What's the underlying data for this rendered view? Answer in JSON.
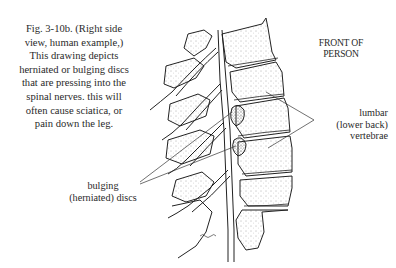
{
  "figure": {
    "caption_lines": [
      "Fig. 3-10b. (Right side",
      "view, human example,)",
      "This drawing depicts",
      "herniated or bulging discs",
      "that are pressing into the",
      "spinal nerves. this will",
      "often cause sciatica, or",
      "pain down the leg."
    ],
    "orientation_label_lines": [
      "FRONT OF",
      "PERSON"
    ],
    "labels": {
      "lumbar_lines": [
        "lumbar",
        "(lower back)",
        "vertebrae"
      ],
      "discs_lines": [
        "bulging",
        "(herniated) discs"
      ]
    },
    "illustration": {
      "subject": "lumbar spine, right side view, with herniated discs pressing on spinal nerves",
      "artist_signature": "S.W.P.G."
    }
  }
}
